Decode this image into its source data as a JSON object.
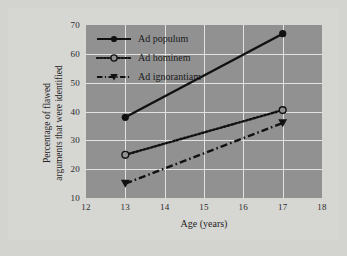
{
  "chart_data": {
    "type": "line",
    "title": "",
    "xlabel": "Age (years)",
    "ylabel": "Percentage of flawed arguments that were identified",
    "ylabel_line1": "Percentage of flawed",
    "ylabel_line2": "arguments that were identified",
    "x": [
      13,
      17
    ],
    "xlim": [
      12,
      18
    ],
    "ylim": [
      10,
      70
    ],
    "xticks": [
      "12",
      "13",
      "14",
      "15",
      "16",
      "17",
      "18"
    ],
    "yticks": [
      "10",
      "20",
      "30",
      "40",
      "50",
      "60",
      "70"
    ],
    "grid": true,
    "legend_position": "top-left",
    "series": [
      {
        "name": "Ad populum",
        "values": [
          38,
          67
        ],
        "linestyle": "solid",
        "marker": "filled-circle",
        "color": "#111111"
      },
      {
        "name": "Ad hominem",
        "values": [
          25,
          40.5
        ],
        "linestyle": "dotted",
        "marker": "open-circle",
        "color": "#111111"
      },
      {
        "name": "Ad ignorantiam",
        "values": [
          15,
          36
        ],
        "linestyle": "dashed",
        "marker": "filled-triangle-down",
        "color": "#111111"
      }
    ]
  },
  "colors": {
    "plot_background": "#919191",
    "figure_background": "#d6d6d3",
    "gridline": "#e2e2e0",
    "line": "#111111",
    "text": "#242424"
  }
}
